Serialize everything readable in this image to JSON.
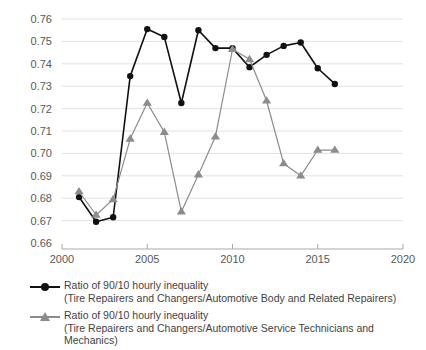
{
  "chart_data": {
    "type": "line",
    "title": "",
    "xlabel": "",
    "ylabel": "",
    "xlim": [
      2000,
      2020
    ],
    "ylim": [
      0.66,
      0.765
    ],
    "xticks": [
      2000,
      2005,
      2010,
      2015,
      2020
    ],
    "yticks": [
      0.66,
      0.67,
      0.68,
      0.69,
      0.7,
      0.71,
      0.72,
      0.73,
      0.74,
      0.75,
      0.76
    ],
    "ytick_labels": [
      "0.66",
      "0.67",
      "0.68",
      "0.69",
      "0.70",
      "0.71",
      "0.72",
      "0.73",
      "0.74",
      "0.75",
      "0.76"
    ],
    "xtick_labels": [
      "2000",
      "2005",
      "2010",
      "2015",
      "2020"
    ],
    "grid": "horizontal",
    "legend_position": "below",
    "x": [
      2001,
      2002,
      2003,
      2004,
      2005,
      2006,
      2007,
      2008,
      2009,
      2010,
      2011,
      2012,
      2013,
      2014,
      2015,
      2016,
      2017
    ],
    "series": [
      {
        "name": "Ratio of 90/10 hourly inequality",
        "sublabel": "(Tire Repairers and Changers/Automotive Body and Related Repairers)",
        "marker": "circle",
        "color": "#111111",
        "values": [
          0.6805,
          0.6695,
          0.6715,
          0.7345,
          0.7555,
          0.752,
          0.7225,
          0.755,
          0.747,
          0.747,
          0.7385,
          0.744,
          0.748,
          0.7495,
          0.738,
          0.731,
          null
        ]
      },
      {
        "name": "Ratio of 90/10 hourly inequality",
        "sublabel": "(Tire Repairers and Changers/Automotive Service Technicians and Mechanics)",
        "marker": "triangle",
        "color": "#8c8c8c",
        "values": [
          0.683,
          0.6725,
          0.6795,
          0.7065,
          0.7225,
          0.7095,
          0.674,
          0.6905,
          0.7075,
          0.7465,
          0.742,
          0.7235,
          0.6955,
          0.69,
          0.7015,
          0.7015,
          null
        ]
      }
    ],
    "legend": [
      {
        "label": "Ratio of 90/10 hourly inequality",
        "sublabel": "(Tire Repairers and Changers/Automotive Body and Related Repairers)",
        "marker": "circle-line",
        "color": "#111111"
      },
      {
        "label": "Ratio of 90/10 hourly inequality",
        "sublabel": "(Tire Repairers and Changers/Automotive Service Technicians and Mechanics)",
        "marker": "triangle-line",
        "color": "#8c8c8c"
      }
    ]
  }
}
